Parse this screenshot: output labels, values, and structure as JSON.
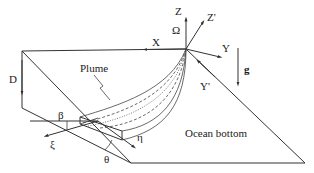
{
  "diagram": {
    "type": "schematic",
    "labels": {
      "Z": "Z",
      "Z_prime": "Z'",
      "Omega": "Ω",
      "X": "X",
      "Y": "Y",
      "Y_prime": "Y'",
      "g": "g",
      "D": "D",
      "plume": "Plume",
      "beta": "β",
      "xi": "ξ",
      "eta": "η",
      "theta": "θ",
      "ocean_bottom": "Ocean bottom"
    }
  }
}
